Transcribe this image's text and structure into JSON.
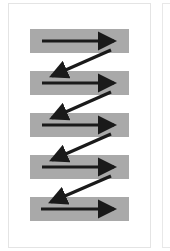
{
  "diagram": {
    "title": "",
    "pattern": "z-pattern zigzag reading flow",
    "colors": {
      "background": "#ffffff",
      "panel_border": "#e4e4e4",
      "bar": "#a9a9a9",
      "arrow": "#1a1a1a"
    },
    "bars": [
      {
        "id": 1,
        "top": 29
      },
      {
        "id": 2,
        "top": 71
      },
      {
        "id": 3,
        "top": 113
      },
      {
        "id": 4,
        "top": 155
      },
      {
        "id": 5,
        "top": 197
      }
    ],
    "arrows": [
      {
        "type": "horizontal",
        "row": 1,
        "direction": "right"
      },
      {
        "type": "diagonal",
        "from_row": 1,
        "to_row": 2,
        "direction": "down-left"
      },
      {
        "type": "horizontal",
        "row": 2,
        "direction": "right"
      },
      {
        "type": "diagonal",
        "from_row": 2,
        "to_row": 3,
        "direction": "down-left"
      },
      {
        "type": "horizontal",
        "row": 3,
        "direction": "right"
      },
      {
        "type": "diagonal",
        "from_row": 3,
        "to_row": 4,
        "direction": "down-left"
      },
      {
        "type": "horizontal",
        "row": 4,
        "direction": "right"
      },
      {
        "type": "diagonal",
        "from_row": 4,
        "to_row": 5,
        "direction": "down-left"
      },
      {
        "type": "horizontal",
        "row": 5,
        "direction": "right"
      }
    ]
  }
}
